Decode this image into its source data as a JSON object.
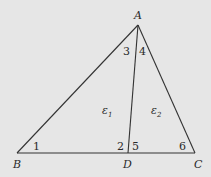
{
  "diagram": {
    "type": "triangle-with-cevian",
    "vertices": {
      "A": {
        "label": "A",
        "x": 138,
        "y": 25
      },
      "B": {
        "label": "B",
        "x": 17,
        "y": 153
      },
      "C": {
        "label": "C",
        "x": 195,
        "y": 153
      },
      "D": {
        "label": "D",
        "x": 128,
        "y": 153
      }
    },
    "segments": [
      "AB",
      "AC",
      "BC",
      "AD"
    ],
    "angle_labels": {
      "a1": "1",
      "a2": "2",
      "a3": "3",
      "a4": "4",
      "a5": "5",
      "a6": "6"
    },
    "region_labels": {
      "e1": {
        "base": "ε",
        "sub": "1"
      },
      "e2": {
        "base": "ε",
        "sub": "2"
      }
    },
    "colors": {
      "background": "#e6e6e6",
      "line": "#333333",
      "text": "#2a2a2a"
    }
  }
}
